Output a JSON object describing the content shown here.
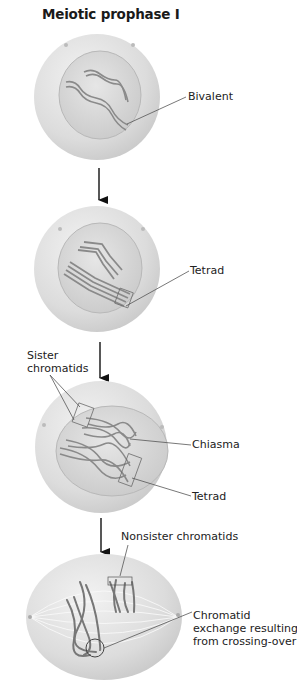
{
  "title": "Meiotic prophase I",
  "stages": [
    {
      "id": "stage-1",
      "labels": [
        "Bivalent"
      ]
    },
    {
      "id": "stage-2",
      "labels": [
        "Tetrad"
      ]
    },
    {
      "id": "stage-3",
      "labels": [
        "Sister chromatids",
        "Chiasma",
        "Tetrad"
      ]
    },
    {
      "id": "stage-4",
      "labels": [
        "Nonsister chromatids",
        "Chromatid exchange resulting from crossing-over"
      ]
    }
  ],
  "labels": {
    "bivalent": "Bivalent",
    "tetrad_1": "Tetrad",
    "sister_line1": "Sister",
    "sister_line2": "chromatids",
    "chiasma": "Chiasma",
    "tetrad_2": "Tetrad",
    "nonsister": "Nonsister chromatids",
    "exchange_line1": "Chromatid",
    "exchange_line2": "exchange resulting",
    "exchange_line3": "from crossing-over"
  },
  "colors": {
    "cell": "#e2e2e2",
    "nucleus": "#d4d4d4",
    "chromosome": "#8a8a8a",
    "leader": "#555555",
    "arrow": "#111111"
  }
}
